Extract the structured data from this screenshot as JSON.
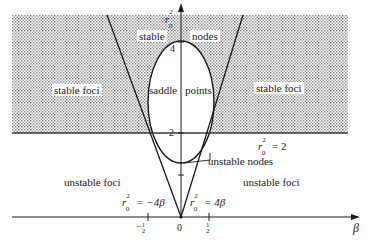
{
  "figure": {
    "axes": {
      "x_label": "β",
      "y_label": "r",
      "y_label_sup": "2",
      "y_label_sub": "0",
      "x_ticks": [
        {
          "sign": "−",
          "num": "1",
          "den": "2"
        },
        {
          "value": "0"
        },
        {
          "num": "1",
          "den": "2"
        }
      ],
      "y_ticks": [
        "4",
        "2"
      ]
    },
    "regions": {
      "stable": "stable",
      "nodes": "nodes",
      "stable_foci_left": "stable foci",
      "stable_foci_right": "stable foci",
      "saddle": "saddle",
      "points": "points",
      "unstable_nodes": "unstable nodes",
      "unstable_foci_left": "unstable foci",
      "unstable_foci_right": "unstable foci"
    },
    "curves": {
      "horizontal_line": {
        "lhs": "r",
        "sup": "2",
        "sub": "0",
        "rhs": " = 2"
      },
      "left_line": {
        "lhs": "r",
        "sup": "2",
        "sub": "0",
        "rhs": " = −4β"
      },
      "right_line": {
        "lhs": "r",
        "sup": "2",
        "sub": "0",
        "rhs": " = 4β"
      }
    },
    "colors": {
      "ink": "#1a1a1a",
      "shading": "#9a9a9a",
      "background": "#ffffff"
    }
  }
}
